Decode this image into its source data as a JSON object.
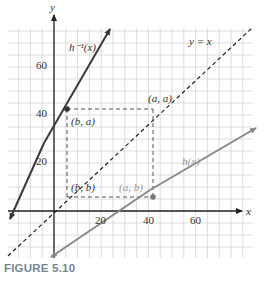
{
  "figure": {
    "caption": "FIGURE 5.10"
  },
  "chart_data": {
    "type": "line",
    "title": "",
    "xlabel": "x",
    "ylabel": "y",
    "xlim": [
      -20,
      85
    ],
    "ylim": [
      -20,
      75
    ],
    "grid": true,
    "grid_step": 5,
    "x_ticks": [
      20,
      40,
      60
    ],
    "y_ticks": [
      20,
      40,
      60
    ],
    "x_tick_labels": [
      "20",
      "40",
      "60"
    ],
    "y_tick_labels": [
      "20",
      "40",
      "60"
    ],
    "series": [
      {
        "name": "h^-1(x)",
        "label": "h⁻¹(x)",
        "style": "solid",
        "color": "#3a3a3a",
        "x": [
          -19,
          22
        ],
        "y": [
          -5,
          75
        ]
      },
      {
        "name": "y = x",
        "label": "y = x",
        "style": "dashed",
        "color": "#222222",
        "x": [
          -18,
          82
        ],
        "y": [
          -18,
          82
        ]
      },
      {
        "name": "h(x)",
        "label": "h(x)",
        "style": "solid",
        "color": "#8a8a8a",
        "x": [
          0,
          86
        ],
        "y": [
          -20,
          22
        ]
      }
    ],
    "points": [
      {
        "label": "(b, a)",
        "x": 5.5,
        "y": 42
      },
      {
        "label": "(a, a)",
        "x": 42,
        "y": 42
      },
      {
        "label": "(b, b)",
        "x": 5.5,
        "y": 5.5
      },
      {
        "label": "(a, b)",
        "x": 42,
        "y": 5.5
      }
    ],
    "annotations": [
      "h⁻¹(x)",
      "y = x",
      "h(x)",
      "(a, a)",
      "(b, a)",
      "(b, b)",
      "(a, b)"
    ]
  },
  "labels": {
    "y_axis": "y",
    "x_axis": "x",
    "h_inv": "h⁻¹(x)",
    "y_eq_x": "y = x",
    "h": "h(x)",
    "pt_aa": "(a, a)",
    "pt_ba": "(b, a)",
    "pt_bb": "(b, b)",
    "pt_ab": "(a, b)",
    "tick_x20": "20",
    "tick_x40": "40",
    "tick_x60": "60",
    "tick_y20": "20",
    "tick_y40": "40",
    "tick_y60": "60"
  }
}
